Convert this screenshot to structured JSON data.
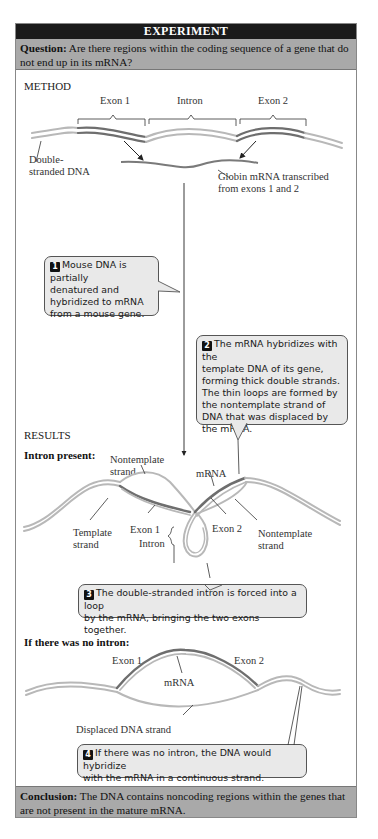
{
  "header": {
    "title": "EXPERIMENT"
  },
  "question": {
    "label": "Question:",
    "text": " Are there regions within the coding sequence of a gene that do not end up in its mRNA?"
  },
  "method": {
    "heading": "METHOD",
    "labels": {
      "exon1": "Exon 1",
      "intron": "Intron",
      "exon2": "Exon 2",
      "dna_line1": "Double-",
      "dna_line2": "stranded DNA",
      "mrna_line1": "Globin mRNA transcribed",
      "mrna_line2": "from exons 1 and 2"
    },
    "callout1": {
      "number": "1",
      "lines": [
        "Mouse DNA is partially",
        "denatured and",
        "hybridized to mRNA",
        "from a mouse gene."
      ]
    }
  },
  "callout2": {
    "number": "2",
    "lines": [
      "The mRNA hybridizes with the",
      "template DNA of its gene,",
      "forming thick double strands.",
      "The thin loops are formed by",
      "the nontemplate strand of",
      "DNA that was displaced by",
      "the mRNA."
    ]
  },
  "results": {
    "heading": "RESULTS",
    "intron_present": {
      "subheading": "Intron present:",
      "labels": {
        "nontemplate_left_1": "Nontemplate",
        "nontemplate_left_2": "strand",
        "mrna": "mRNA",
        "template_1": "Template",
        "template_2": "strand",
        "exon1": "Exon 1",
        "exon2": "Exon 2",
        "intron": "Intron",
        "nontemplate_right_1": "Nontemplate",
        "nontemplate_right_2": "strand"
      },
      "callout3": {
        "number": "3",
        "lines": [
          "The double-stranded intron is forced into a loop",
          "by the mRNA, bringing the two exons together."
        ]
      }
    },
    "no_intron": {
      "subheading": "If there was no intron:",
      "labels": {
        "exon1": "Exon 1",
        "exon2": "Exon 2",
        "mrna": "mRNA",
        "displaced": "Displaced DNA strand"
      },
      "callout4": {
        "number": "4",
        "lines": [
          "If there was no intron, the DNA would hybridize",
          "with the mRNA in a continuous strand."
        ]
      }
    }
  },
  "conclusion": {
    "label": "Conclusion:",
    "text": " The DNA contains noncoding regions within the genes that are not present in the mature mRNA."
  },
  "colors": {
    "header_bg": "#1b1b1b",
    "band_bg": "#a9a9a9",
    "dna_light": "#b5b5b5",
    "exon_dark": "#6e6e6e",
    "callout_bg": "#e9e9e9"
  }
}
